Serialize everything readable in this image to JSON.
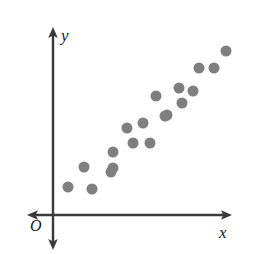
{
  "figure": {
    "background_color": "#ffffff",
    "width": 256,
    "height": 254
  },
  "axes": {
    "origin_label": "O",
    "x_label": "x",
    "y_label": "y",
    "axis_color": "#3a3a3a",
    "origin_px": {
      "x": 53,
      "y": 215
    },
    "x_axis": {
      "from_px": 27,
      "to_px": 232,
      "y_px": 215,
      "arrow_both_ends": true
    },
    "y_axis": {
      "from_px": 27,
      "to_px": 250,
      "x_px": 53,
      "arrow_both_ends": true
    }
  },
  "chart_data": {
    "type": "scatter",
    "title": "",
    "subtitle": "",
    "xlabel": "x",
    "ylabel": "y",
    "grid": false,
    "legend": null,
    "axis_ticks": {
      "x": [],
      "y": []
    },
    "xlim": [
      0,
      10
    ],
    "ylim": [
      0,
      10
    ],
    "marker": {
      "shape": "circle",
      "color": "#7f7f7f",
      "diameter_px": 11,
      "count": 19
    },
    "annotations": [
      "O"
    ],
    "points_px": [
      {
        "x": 68,
        "y": 187
      },
      {
        "x": 84,
        "y": 167
      },
      {
        "x": 92,
        "y": 189
      },
      {
        "x": 111,
        "y": 172
      },
      {
        "x": 113,
        "y": 152
      },
      {
        "x": 113,
        "y": 168
      },
      {
        "x": 127,
        "y": 128
      },
      {
        "x": 133,
        "y": 143
      },
      {
        "x": 143,
        "y": 123
      },
      {
        "x": 150,
        "y": 143
      },
      {
        "x": 156,
        "y": 96
      },
      {
        "x": 165,
        "y": 116
      },
      {
        "x": 167,
        "y": 115
      },
      {
        "x": 179,
        "y": 88
      },
      {
        "x": 182,
        "y": 103
      },
      {
        "x": 193,
        "y": 91
      },
      {
        "x": 199,
        "y": 68
      },
      {
        "x": 214,
        "y": 68
      },
      {
        "x": 226,
        "y": 51
      }
    ],
    "x": [
      0.8,
      1.7,
      2.2,
      3.2,
      3.3,
      3.3,
      4.1,
      4.4,
      5.0,
      5.4,
      5.7,
      6.2,
      6.3,
      7.0,
      7.2,
      7.8,
      8.1,
      8.9,
      9.6
    ],
    "y": [
      1.6,
      2.7,
      1.5,
      2.4,
      3.5,
      2.6,
      4.8,
      4.0,
      5.1,
      4.0,
      6.5,
      5.5,
      5.5,
      7.0,
      6.2,
      6.9,
      8.1,
      8.1,
      9.0
    ]
  }
}
